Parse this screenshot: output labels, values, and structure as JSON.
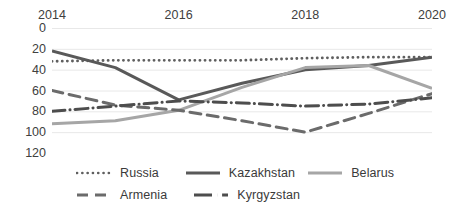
{
  "chart_data": {
    "type": "line",
    "title": "",
    "subtitle": "",
    "xlabel": "",
    "ylabel": "",
    "x": [
      2014,
      2015,
      2016,
      2017,
      2018,
      2019,
      2020
    ],
    "x_tick_labels": [
      "2014",
      "2016",
      "2018",
      "2020"
    ],
    "x_tick_values": [
      2014,
      2016,
      2018,
      2020
    ],
    "y_tick_labels": [
      "0",
      "20",
      "40",
      "60",
      "80",
      "100",
      "120"
    ],
    "y_tick_values": [
      0,
      20,
      40,
      60,
      80,
      100,
      120
    ],
    "ylim": [
      0,
      120
    ],
    "y_axis_inverted": true,
    "xlim": [
      2014,
      2020
    ],
    "grid": "horizontal",
    "legend_position": "bottom",
    "axis_label_position": "top",
    "series": [
      {
        "name": "Russia",
        "line_style": "dotted",
        "color": "#5f5f5f",
        "values": [
          32,
          31,
          31,
          31,
          29,
          28,
          28
        ]
      },
      {
        "name": "Kazakhstan",
        "line_style": "solid",
        "color": "#595959",
        "values": [
          22,
          38,
          69,
          53,
          40,
          36,
          28
        ]
      },
      {
        "name": "Belarus",
        "line_style": "solid",
        "color": "#a6a6a6",
        "values": [
          92,
          89,
          79,
          57,
          38,
          36,
          58
        ]
      },
      {
        "name": "Armenia",
        "line_style": "dashed",
        "color": "#6b6b6b",
        "values": [
          60,
          74,
          79,
          89,
          100,
          82,
          63
        ]
      },
      {
        "name": "Kyrgyzstan",
        "line_style": "dash-dot",
        "color": "#4d4d4d",
        "values": [
          80,
          75,
          70,
          72,
          75,
          73,
          67
        ]
      }
    ]
  },
  "legend": {
    "rows": [
      [
        {
          "label": "Russia",
          "icon": "dotted-line-icon"
        },
        {
          "label": "Kazakhstan",
          "icon": "solid-line-icon"
        },
        {
          "label": "Belarus",
          "icon": "light-solid-line-icon"
        }
      ],
      [
        {
          "label": "Armenia",
          "icon": "dashed-line-icon"
        },
        {
          "label": "Kyrgyzstan",
          "icon": "dash-dot-line-icon"
        }
      ]
    ]
  },
  "colors": {
    "gridline": "#e8e8e8",
    "background": "#ffffff",
    "text": "#3a3a3a"
  }
}
